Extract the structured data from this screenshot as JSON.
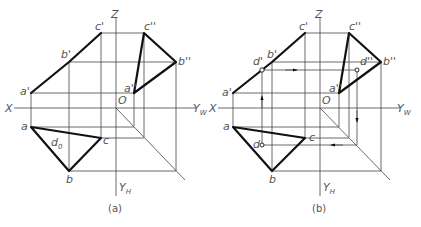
{
  "panels": [
    {
      "caption": "(a)",
      "axes": {
        "x": "X",
        "z": "Z",
        "yw": "Y",
        "yw_sub": "W",
        "yh": "Y",
        "yh_sub": "H",
        "origin": "O"
      },
      "front_view": {
        "a": "a'",
        "b": "b'",
        "c": "c'"
      },
      "side_view": {
        "a": "a''",
        "b": "b''",
        "c": "c''"
      },
      "top_view": {
        "a": "a",
        "b": "b",
        "c": "c",
        "d0": "d",
        "d0_sub": "0"
      }
    },
    {
      "caption": "(b)",
      "axes": {
        "x": "X",
        "z": "Z",
        "yw": "Y",
        "yw_sub": "W",
        "yh": "Y",
        "yh_sub": "H",
        "origin": "O"
      },
      "front_view": {
        "a": "a'",
        "b": "b'",
        "c": "c'",
        "d": "d'"
      },
      "side_view": {
        "a": "a''",
        "b": "b''",
        "c": "c''",
        "d": "d''"
      },
      "top_view": {
        "a": "a",
        "b": "b",
        "c": "c",
        "d": "d"
      }
    }
  ]
}
